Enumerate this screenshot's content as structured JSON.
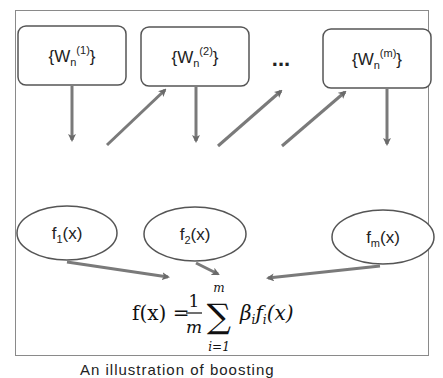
{
  "diagram": {
    "type": "ensemble-boosting-illustration",
    "weight_sets": [
      {
        "id": "w1",
        "base": "{W",
        "sub": "n",
        "sup": "(1)",
        "close": "}"
      },
      {
        "id": "w2",
        "base": "{W",
        "sub": "n",
        "sup": "(2)",
        "close": "}"
      },
      {
        "id": "wm",
        "base": "{W",
        "sub": "n",
        "sup": "(m)",
        "close": "}"
      }
    ],
    "ellipsis": "...",
    "learners": [
      {
        "id": "f1",
        "base": "f",
        "sub": "1",
        "arg": "(x)"
      },
      {
        "id": "f2",
        "base": "f",
        "sub": "2",
        "arg": "(x)"
      },
      {
        "id": "fm",
        "base": "f",
        "sub": "m",
        "arg": "(x)"
      }
    ],
    "formula": {
      "lhs": "f(x) =",
      "frac_num": "1",
      "frac_den": "m",
      "sum_symbol": "∑",
      "sum_upper": "m",
      "sum_lower": "i=1",
      "term": "β",
      "term_sub": "i",
      "term2": "f",
      "term2_sub": "i",
      "term2_arg": "(x)"
    },
    "edges": [
      {
        "from": "w1",
        "to": "f1"
      },
      {
        "from": "f1",
        "to": "w2"
      },
      {
        "from": "w2",
        "to": "f2"
      },
      {
        "from": "f2",
        "to": "ellipsis"
      },
      {
        "from": "ellipsis",
        "to": "wm"
      },
      {
        "from": "wm",
        "to": "fm"
      },
      {
        "from": "f1",
        "to": "formula"
      },
      {
        "from": "f2",
        "to": "formula"
      },
      {
        "from": "fm",
        "to": "formula"
      }
    ],
    "colors": {
      "stroke": "#555555",
      "arrow": "#7a7a7a",
      "frame": "#8a8a8a"
    }
  },
  "caption": "An illustration of boosting"
}
